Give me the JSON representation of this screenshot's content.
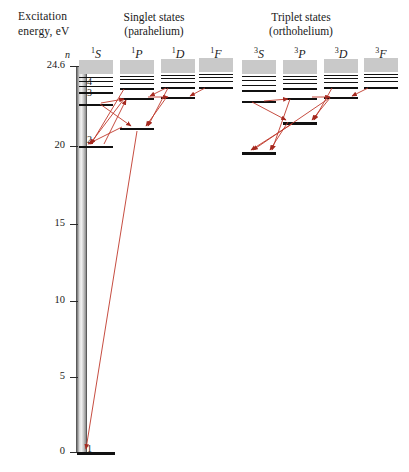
{
  "axis": {
    "title_line1": "Excitation",
    "title_line2": "energy, eV",
    "n_header": "n",
    "ticks": [
      {
        "label": "24.6",
        "value": 24.6,
        "y": 66
      },
      {
        "label": "20",
        "value": 20,
        "y": 146
      },
      {
        "label": "15",
        "value": 15,
        "y": 224
      },
      {
        "label": "10",
        "value": 10,
        "y": 301
      },
      {
        "label": "5",
        "value": 5,
        "y": 377
      },
      {
        "label": "0",
        "value": 0,
        "y": 452
      }
    ],
    "n_labels": [
      {
        "label": "∞",
        "y": 64
      },
      {
        "label": "4",
        "y": 82
      },
      {
        "label": "3",
        "y": 93
      },
      {
        "label": "2",
        "y": 140
      },
      {
        "label": "1",
        "y": 449
      }
    ]
  },
  "groups": [
    {
      "name": "singlet",
      "line1": "Singlet states",
      "line2": "(parahelium)",
      "cx": 154,
      "y": 12
    },
    {
      "name": "triplet",
      "line1": "Triplet states",
      "line2": "(orthohelium)",
      "cx": 301,
      "y": 12
    }
  ],
  "columns": [
    {
      "id": "1S",
      "superscript": "1",
      "letter": "S",
      "cx": 96,
      "head_y": 48
    },
    {
      "id": "1P",
      "superscript": "1",
      "letter": "P",
      "cx": 137,
      "head_y": 48
    },
    {
      "id": "1D",
      "superscript": "1",
      "letter": "D",
      "cx": 178,
      "head_y": 48
    },
    {
      "id": "1F",
      "superscript": "1",
      "letter": "F",
      "cx": 216,
      "head_y": 48
    },
    {
      "id": "3S",
      "superscript": "3",
      "letter": "S",
      "cx": 259,
      "head_y": 48
    },
    {
      "id": "3P",
      "superscript": "3",
      "letter": "P",
      "cx": 300,
      "head_y": 48
    },
    {
      "id": "3D",
      "superscript": "3",
      "letter": "D",
      "cx": 341,
      "head_y": 48
    },
    {
      "id": "3F",
      "superscript": "3",
      "letter": "F",
      "cx": 381,
      "head_y": 48
    }
  ],
  "chart_data": {
    "type": "line",
    "xlabel": "",
    "ylabel": "Excitation energy, eV",
    "ylim": [
      0,
      24.6
    ],
    "grid": false,
    "legend": "none",
    "series": [
      {
        "name": "1S",
        "values": [
          0,
          20.6,
          22.9,
          23.6,
          23.9,
          24.0
        ]
      },
      {
        "name": "1P",
        "values": [
          21.2,
          23.1,
          23.7,
          23.9,
          24.05
        ]
      },
      {
        "name": "1D",
        "values": [
          23.07,
          23.74,
          24.0,
          24.1
        ]
      },
      {
        "name": "1F",
        "values": [
          23.74,
          24.0,
          24.15
        ]
      },
      {
        "name": "3S",
        "values": [
          19.8,
          22.7,
          23.6,
          23.9,
          24.0
        ]
      },
      {
        "name": "3P",
        "values": [
          20.96,
          23.0,
          23.7,
          23.95,
          24.05
        ]
      },
      {
        "name": "3D",
        "values": [
          23.07,
          23.74,
          24.0,
          24.1
        ]
      },
      {
        "name": "3F",
        "values": [
          23.74,
          24.0,
          24.15
        ]
      }
    ]
  },
  "levels": [
    {
      "col": "1S",
      "n": "1",
      "y": 452,
      "w": 38,
      "h": 3
    },
    {
      "col": "1S",
      "n": "2",
      "y": 146,
      "w": 34,
      "h": 2
    },
    {
      "col": "1S",
      "n": "3",
      "y": 104,
      "w": 34,
      "h": 2
    },
    {
      "col": "1S",
      "n": "4",
      "y": 92,
      "w": 34,
      "h": 1.6
    },
    {
      "col": "1S",
      "n": "5",
      "y": 86,
      "w": 34,
      "h": 1.4
    },
    {
      "col": "1S",
      "n": "6",
      "y": 81,
      "w": 34,
      "h": 1.4
    },
    {
      "col": "1S",
      "n": "7",
      "y": 77,
      "w": 34,
      "h": 1.2
    },
    {
      "col": "1P",
      "n": "2",
      "y": 128,
      "w": 34,
      "h": 2.4
    },
    {
      "col": "1P",
      "n": "3",
      "y": 98,
      "w": 34,
      "h": 2
    },
    {
      "col": "1P",
      "n": "4",
      "y": 88,
      "w": 34,
      "h": 1.6
    },
    {
      "col": "1P",
      "n": "5",
      "y": 83,
      "w": 34,
      "h": 1.4
    },
    {
      "col": "1P",
      "n": "6",
      "y": 79,
      "w": 34,
      "h": 1.2
    },
    {
      "col": "1P",
      "n": "7",
      "y": 76,
      "w": 34,
      "h": 1.2
    },
    {
      "col": "1D",
      "n": "3",
      "y": 97,
      "w": 34,
      "h": 2
    },
    {
      "col": "1D",
      "n": "4",
      "y": 87,
      "w": 34,
      "h": 1.6
    },
    {
      "col": "1D",
      "n": "5",
      "y": 82,
      "w": 34,
      "h": 1.4
    },
    {
      "col": "1D",
      "n": "6",
      "y": 78,
      "w": 34,
      "h": 1.2
    },
    {
      "col": "1D",
      "n": "7",
      "y": 75,
      "w": 34,
      "h": 1.2
    },
    {
      "col": "1F",
      "n": "4",
      "y": 87,
      "w": 34,
      "h": 1.8
    },
    {
      "col": "1F",
      "n": "5",
      "y": 81,
      "w": 34,
      "h": 1.4
    },
    {
      "col": "1F",
      "n": "6",
      "y": 77,
      "w": 34,
      "h": 1.2
    },
    {
      "col": "1F",
      "n": "7",
      "y": 74,
      "w": 34,
      "h": 1.2
    },
    {
      "col": "3S",
      "n": "2",
      "y": 152,
      "w": 34,
      "h": 2.6
    },
    {
      "col": "3S",
      "n": "3",
      "y": 101,
      "w": 34,
      "h": 2
    },
    {
      "col": "3S",
      "n": "4",
      "y": 90,
      "w": 34,
      "h": 1.6
    },
    {
      "col": "3S",
      "n": "5",
      "y": 85,
      "w": 34,
      "h": 1.4
    },
    {
      "col": "3S",
      "n": "6",
      "y": 80,
      "w": 34,
      "h": 1.2
    },
    {
      "col": "3S",
      "n": "7",
      "y": 76,
      "w": 34,
      "h": 1.2
    },
    {
      "col": "3P",
      "n": "2",
      "y": 122,
      "w": 34,
      "h": 2.6
    },
    {
      "col": "3P",
      "n": "3",
      "y": 98,
      "w": 34,
      "h": 2
    },
    {
      "col": "3P",
      "n": "4",
      "y": 88,
      "w": 34,
      "h": 1.6
    },
    {
      "col": "3P",
      "n": "5",
      "y": 83,
      "w": 34,
      "h": 1.4
    },
    {
      "col": "3P",
      "n": "6",
      "y": 79,
      "w": 34,
      "h": 1.2
    },
    {
      "col": "3P",
      "n": "7",
      "y": 76,
      "w": 34,
      "h": 1.2
    },
    {
      "col": "3D",
      "n": "3",
      "y": 97,
      "w": 34,
      "h": 2
    },
    {
      "col": "3D",
      "n": "4",
      "y": 87,
      "w": 34,
      "h": 1.6
    },
    {
      "col": "3D",
      "n": "5",
      "y": 82,
      "w": 34,
      "h": 1.4
    },
    {
      "col": "3D",
      "n": "6",
      "y": 78,
      "w": 34,
      "h": 1.2
    },
    {
      "col": "3D",
      "n": "7",
      "y": 75,
      "w": 34,
      "h": 1.2
    },
    {
      "col": "3F",
      "n": "4",
      "y": 87,
      "w": 34,
      "h": 1.8
    },
    {
      "col": "3F",
      "n": "5",
      "y": 81,
      "w": 34,
      "h": 1.4
    },
    {
      "col": "3F",
      "n": "6",
      "y": 77,
      "w": 34,
      "h": 1.2
    },
    {
      "col": "3F",
      "n": "7",
      "y": 74,
      "w": 34,
      "h": 1.2
    }
  ],
  "continuum_blocks": [
    {
      "col": "1S",
      "y": 60,
      "w": 34,
      "h": 14
    },
    {
      "col": "1P",
      "y": 60,
      "w": 34,
      "h": 14
    },
    {
      "col": "1D",
      "y": 59,
      "w": 34,
      "h": 14
    },
    {
      "col": "1F",
      "y": 58,
      "w": 34,
      "h": 14
    },
    {
      "col": "3S",
      "y": 60,
      "w": 34,
      "h": 14
    },
    {
      "col": "3P",
      "y": 60,
      "w": 34,
      "h": 14
    },
    {
      "col": "3D",
      "y": 59,
      "w": 34,
      "h": 14
    },
    {
      "col": "3F",
      "y": 58,
      "w": 34,
      "h": 14
    }
  ],
  "transitions": {
    "color": "#c0392b",
    "lines": [
      {
        "from": "1P2",
        "to": "1S1",
        "x1": 137,
        "y1": 131,
        "x2": 86,
        "y2": 449
      },
      {
        "from": "1P2",
        "to": "1S2",
        "x1": 122,
        "y1": 127,
        "x2": 88,
        "y2": 144
      },
      {
        "from": "1P3",
        "to": "1S2",
        "x1": 124,
        "y1": 99,
        "x2": 90,
        "y2": 144
      },
      {
        "from": "1P4",
        "to": "1S2",
        "x1": 124,
        "y1": 89,
        "x2": 91,
        "y2": 144
      },
      {
        "from": "1S3",
        "to": "1P2",
        "x1": 100,
        "y1": 104,
        "x2": 131,
        "y2": 126
      },
      {
        "from": "1D3",
        "to": "1P2",
        "x1": 166,
        "y1": 98,
        "x2": 146,
        "y2": 126
      },
      {
        "from": "1D4",
        "to": "1P2",
        "x1": 168,
        "y1": 88,
        "x2": 148,
        "y2": 126
      },
      {
        "from": "1S3",
        "to": "1P3",
        "x1": 101,
        "y1": 103,
        "x2": 124,
        "y2": 99
      },
      {
        "from": "1P3",
        "to": "1D3",
        "x1": 148,
        "y1": 97,
        "x2": 168,
        "y2": 97
      },
      {
        "from": "1F4",
        "to": "1D3",
        "x1": 205,
        "y1": 88,
        "x2": 190,
        "y2": 96
      },
      {
        "from": "1D4",
        "to": "1P3",
        "x1": 166,
        "y1": 88,
        "x2": 150,
        "y2": 96
      },
      {
        "from": "1S2",
        "to": "1P3",
        "x1": 104,
        "y1": 144,
        "x2": 126,
        "y2": 100
      },
      {
        "from": "3P2",
        "to": "3S2",
        "x1": 288,
        "y1": 122,
        "x2": 270,
        "y2": 150
      },
      {
        "from": "3P3",
        "to": "3S2",
        "x1": 290,
        "y1": 99,
        "x2": 272,
        "y2": 150
      },
      {
        "from": "3S3",
        "to": "3P2",
        "x1": 252,
        "y1": 102,
        "x2": 286,
        "y2": 120
      },
      {
        "from": "3D3",
        "to": "3P2",
        "x1": 330,
        "y1": 98,
        "x2": 312,
        "y2": 120
      },
      {
        "from": "3D4",
        "to": "3P2",
        "x1": 332,
        "y1": 88,
        "x2": 314,
        "y2": 120
      },
      {
        "from": "3F4",
        "to": "3D3",
        "x1": 368,
        "y1": 88,
        "x2": 352,
        "y2": 96
      },
      {
        "from": "3P3",
        "to": "3D3",
        "x1": 312,
        "y1": 97,
        "x2": 330,
        "y2": 97
      },
      {
        "from": "3S3",
        "to": "3P3",
        "x1": 264,
        "y1": 101,
        "x2": 288,
        "y2": 99
      },
      {
        "from": "3P2",
        "to": "3S2b",
        "x1": 292,
        "y1": 124,
        "x2": 251,
        "y2": 150
      },
      {
        "from": "3D3",
        "to": "3S2",
        "x1": 328,
        "y1": 99,
        "x2": 253,
        "y2": 150
      }
    ]
  }
}
